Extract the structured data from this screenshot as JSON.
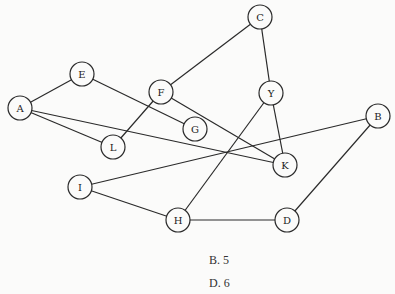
{
  "graph": {
    "nodes": [
      {
        "id": "A",
        "x": 20,
        "y": 108
      },
      {
        "id": "E",
        "x": 82,
        "y": 74
      },
      {
        "id": "F",
        "x": 161,
        "y": 92
      },
      {
        "id": "C",
        "x": 260,
        "y": 17
      },
      {
        "id": "Y",
        "x": 271,
        "y": 93
      },
      {
        "id": "G",
        "x": 195,
        "y": 129
      },
      {
        "id": "L",
        "x": 113,
        "y": 147
      },
      {
        "id": "K",
        "x": 285,
        "y": 165
      },
      {
        "id": "B",
        "x": 378,
        "y": 116
      },
      {
        "id": "I",
        "x": 80,
        "y": 187
      },
      {
        "id": "H",
        "x": 178,
        "y": 220
      },
      {
        "id": "D",
        "x": 287,
        "y": 220
      }
    ],
    "edges": [
      [
        "A",
        "E"
      ],
      [
        "A",
        "L"
      ],
      [
        "A",
        "K"
      ],
      [
        "E",
        "G"
      ],
      [
        "L",
        "F"
      ],
      [
        "F",
        "C"
      ],
      [
        "F",
        "K"
      ],
      [
        "C",
        "Y"
      ],
      [
        "Y",
        "H"
      ],
      [
        "Y",
        "K"
      ],
      [
        "B",
        "I"
      ],
      [
        "B",
        "D"
      ],
      [
        "I",
        "H"
      ],
      [
        "H",
        "D"
      ]
    ],
    "node_radius": 12
  },
  "options": [
    {
      "label": "B.  5"
    },
    {
      "label": "D.  6"
    }
  ]
}
